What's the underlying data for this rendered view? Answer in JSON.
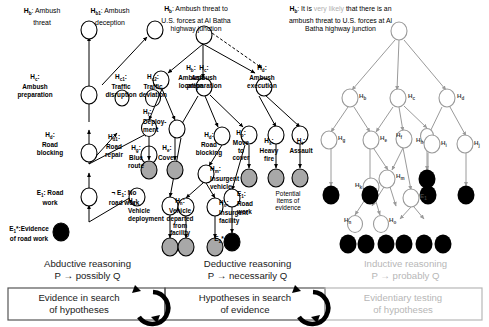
{
  "figure": {
    "title_regions": 3,
    "colors": {
      "node_white": "#ffffff",
      "node_gray": "#a8a8a8",
      "node_black": "#000000",
      "stroke_dark": "#000000",
      "stroke_light": "#b7b7b7",
      "faint_text": "#b0b0b0"
    }
  },
  "headers": {
    "left_top_1": "H",
    "left_top_1_sub": "b",
    "left_top_1_text": ": Ambush\nthreat",
    "left_top_2_sub": "b1",
    "left_top_2_text": ": Ambush\ndeception",
    "middle_sub": "b",
    "middle_text": ": Ambush threat to\nU.S. forces at Al Batha\nhighway junction",
    "right_sub": "b",
    "right_text_a": ": It is ",
    "right_text_faint": "very likely",
    "right_text_b": " that there is an\nambush threat to U.S. forces at Al\nBatha highway junction"
  },
  "left_tree": {
    "nodes": [
      {
        "id": "Hb",
        "label": "H",
        "sub": "b",
        "text": ": Ambush\nthreat",
        "fill": "white"
      },
      {
        "id": "Hb1",
        "label": "H",
        "sub": "b1",
        "text": ": Ambush\ndeception",
        "fill": "white"
      },
      {
        "id": "Hc",
        "label": "H",
        "sub": "c",
        "text": ":\nAmbush\npreparation",
        "fill": "white"
      },
      {
        "id": "Hc1",
        "label": "H",
        "sub": "c1",
        "text": ":\nTraffic\ndisruption",
        "fill": "white"
      },
      {
        "id": "Hc2",
        "label": "H",
        "sub": "c2",
        "text": ":\nTraffic\ndeviation",
        "fill": "white"
      },
      {
        "id": "Hd",
        "label": "H",
        "sub": "d",
        "text": ":\nRoad\nblocking",
        "fill": "white"
      },
      {
        "id": "Hd1",
        "label": "H",
        "sub": "d1",
        "text": ":\nRoad\nrepair",
        "fill": "white"
      },
      {
        "id": "E1",
        "label": "E",
        "sub": "1",
        "text": ": Road\nwork",
        "fill": "white"
      },
      {
        "id": "nE1",
        "label": "¬ E",
        "sub": "1",
        "text": ": No\nroad work",
        "fill": "white"
      },
      {
        "id": "E1s",
        "label": "E*",
        "sub": "1",
        "text": ":Evidence\nof road work",
        "fill": "black"
      }
    ]
  },
  "middle_tree": {
    "nodes": [
      {
        "id": "Hb",
        "label": "H",
        "sub": "b",
        "text": "",
        "fill": "white"
      },
      {
        "id": "Hb2",
        "label": "H",
        "sub": "b",
        "text": ":\nAmbush\nlocation",
        "fill": "white"
      },
      {
        "id": "Hc",
        "label": "H",
        "sub": "c",
        "text": ":\nAmbush\npreparation",
        "fill": "white"
      },
      {
        "id": "Hd",
        "label": "H",
        "sub": "d",
        "text": ":\nAmbush\nexecution",
        "fill": "white"
      },
      {
        "id": "Hf",
        "label": "H",
        "sub": "f",
        "text": ":\nDeploy-\nment",
        "fill": "white"
      },
      {
        "id": "Hg",
        "label": "H",
        "sub": "g",
        "text": ":\nBlue\nroute",
        "fill": "white"
      },
      {
        "id": "He",
        "label": "H",
        "sub": "e",
        "text": ":\nCover",
        "fill": "white"
      },
      {
        "id": "Hd2",
        "label": "H",
        "sub": "d",
        "text": ":\nRoad\nblocking",
        "fill": "white"
      },
      {
        "id": "Hp",
        "label": "H",
        "sub": "p",
        "text": ":\nMove\nto\ncover",
        "fill": "white"
      },
      {
        "id": "Hs",
        "label": "H",
        "sub": "s",
        "text": ":\nHeavy\nfire",
        "fill": "white"
      },
      {
        "id": "Ht",
        "label": "H",
        "sub": "t",
        "text": ":\nAssault",
        "fill": "white"
      },
      {
        "id": "Hm",
        "label": "H",
        "sub": "m",
        "text": ":\nInsurgent\nvehicle",
        "fill": "white"
      },
      {
        "id": "Hk",
        "label": "H",
        "sub": "k",
        "text": ":\nVehicle\ndeployment",
        "fill": "white"
      },
      {
        "id": "Hn",
        "label": "H",
        "sub": "n",
        "text": ":\nVehicle\ndeparted\nfrom\nfacility",
        "fill": "white"
      },
      {
        "id": "Ho",
        "label": "H",
        "sub": "o",
        "text": ":\nInsurgent\nfacility",
        "fill": "white"
      },
      {
        "id": "E1",
        "label": "E",
        "sub": "1",
        "text": ":\nRoad\nwork",
        "fill": "white"
      },
      {
        "id": "E1s",
        "label": "E*",
        "sub": "1",
        "text": "",
        "fill": "black"
      }
    ],
    "evidence_caption": "Potential\nitems of\nevidence"
  },
  "right_tree": {
    "node_labels": [
      "Hₐ",
      "Hᵇ",
      "Hᶜ",
      "Hᵈ",
      "Hₑ",
      "Hᶠ",
      "Hᵍ",
      "Hʰ",
      "Hⁱ",
      "Hʲ",
      "Hᵏ",
      "Hˡ",
      "Hᵐ",
      "Hⁿ",
      "Hᵒ"
    ],
    "visible_labels": [
      "Hₐ",
      "Hᵇ",
      "Hᶜ",
      "Hᵈ",
      "Hₑ",
      "Hᵍ",
      "Hʰ",
      "Hᶠ",
      "Hᵏ",
      "Hˡ",
      "Hᵐ",
      "Hⁿ",
      "Hᵒ",
      "E₁"
    ]
  },
  "reasoning_modes": [
    {
      "name": "Abductive reasoning",
      "formula": "P → possibly Q",
      "muted": false
    },
    {
      "name": "Deductive reasoning",
      "formula": "P → necessarily Q",
      "muted": false
    },
    {
      "name": "Inductive reasoning",
      "formula": "P → probably Q",
      "muted": true
    }
  ],
  "caption_boxes": [
    {
      "text": "Evidence in search\nof hypotheses",
      "muted": false
    },
    {
      "text": "Hypotheses in search\nof evidence",
      "muted": false
    },
    {
      "text": "Evidentiary testing\nof hypotheses",
      "muted": true
    }
  ]
}
